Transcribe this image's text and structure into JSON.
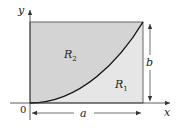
{
  "diagram": {
    "type": "region-split-by-curve",
    "colors": {
      "region_R2": "#d4d4d4",
      "region_R1": "#e6e6e6",
      "curve": "#111111",
      "border": "#333333",
      "axis": "#333333",
      "background": "#ffffff"
    },
    "axes": {
      "x_label": "x",
      "y_label": "y",
      "origin_label": "0"
    },
    "regions": [
      {
        "id": "R2",
        "base": "R",
        "subscript": "2",
        "position": "above curve"
      },
      {
        "id": "R1",
        "base": "R",
        "subscript": "1",
        "position": "below curve"
      }
    ],
    "dimensions": {
      "width_label": "a",
      "height_label": "b"
    }
  }
}
